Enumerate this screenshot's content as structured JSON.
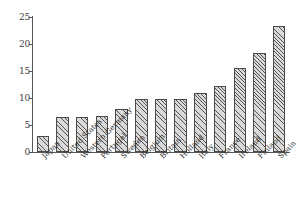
{
  "chart_data": {
    "type": "bar",
    "title": "",
    "subtitle": "",
    "xlabel": "",
    "ylabel": "",
    "ylim": [
      0,
      25
    ],
    "yticks": [
      "0",
      "5",
      "10",
      "15",
      "20",
      "25"
    ],
    "ytick_values": [
      0,
      5,
      10,
      15,
      20,
      25
    ],
    "grid": false,
    "legend": null,
    "categories": [
      "Japan",
      "United States",
      "Western Germany",
      "Portugal",
      "Sweden",
      "Belgium",
      "Britain",
      "Holland",
      "Italy",
      "France",
      "Ireland",
      "Finland",
      "Spain"
    ],
    "values": [
      3.0,
      6.4,
      6.5,
      6.6,
      7.9,
      9.8,
      9.8,
      9.8,
      10.9,
      12.3,
      15.5,
      18.3,
      23.3
    ],
    "bar_style": {
      "fill": "#d9d9d9",
      "hatch": "diagonal",
      "edge": "#4a4a4a"
    },
    "axis_color": "#575757"
  },
  "figure": {
    "background": "#ffffff"
  }
}
